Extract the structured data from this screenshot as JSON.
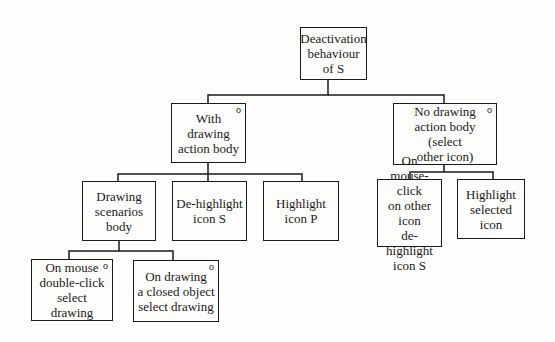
{
  "diagram": {
    "type": "tree",
    "nodes": [
      {
        "id": "root",
        "label": "Deactivation\nbehaviour\nof S",
        "marker": "",
        "x": 300,
        "y": 27,
        "w": 67,
        "h": 53
      },
      {
        "id": "with_drawing",
        "label": "With\ndrawing\naction body",
        "marker": "o",
        "x": 171,
        "y": 103,
        "w": 75,
        "h": 60
      },
      {
        "id": "no_drawing",
        "label": "No drawing\naction body (select\nother icon)",
        "marker": "o",
        "x": 393,
        "y": 103,
        "w": 104,
        "h": 62
      },
      {
        "id": "drawing_scenarios",
        "label": "Drawing\nscenarios\nbody",
        "marker": "",
        "x": 82,
        "y": 181,
        "w": 74,
        "h": 60
      },
      {
        "id": "dehighlight_s",
        "label": "De-highlight\nicon S",
        "marker": "",
        "x": 172,
        "y": 181,
        "w": 75,
        "h": 60
      },
      {
        "id": "highlight_p",
        "label": "Highlight\nicon P",
        "marker": "",
        "x": 263,
        "y": 181,
        "w": 76,
        "h": 60
      },
      {
        "id": "mouse_click_other",
        "label": "On mouse-click\non other icon\nde-highlight\nicon S",
        "marker": "",
        "x": 377,
        "y": 179,
        "w": 65,
        "h": 68
      },
      {
        "id": "highlight_selected",
        "label": "Highlight\nselected\nicon",
        "marker": "",
        "x": 457,
        "y": 179,
        "w": 68,
        "h": 60
      },
      {
        "id": "double_click",
        "label": "On mouse\ndouble-click\nselect drawing",
        "marker": "o",
        "x": 31,
        "y": 259,
        "w": 82,
        "h": 62
      },
      {
        "id": "closed_object",
        "label": "On drawing\na closed object\nselect drawing",
        "marker": "o",
        "x": 133,
        "y": 260,
        "w": 86,
        "h": 62
      }
    ],
    "edges": [
      {
        "from": "root",
        "to": [
          "with_drawing",
          "no_drawing"
        ]
      },
      {
        "from": "with_drawing",
        "to": [
          "drawing_scenarios",
          "dehighlight_s",
          "highlight_p"
        ]
      },
      {
        "from": "no_drawing",
        "to": [
          "mouse_click_other",
          "highlight_selected"
        ]
      },
      {
        "from": "drawing_scenarios",
        "to": [
          "double_click",
          "closed_object"
        ]
      }
    ]
  }
}
